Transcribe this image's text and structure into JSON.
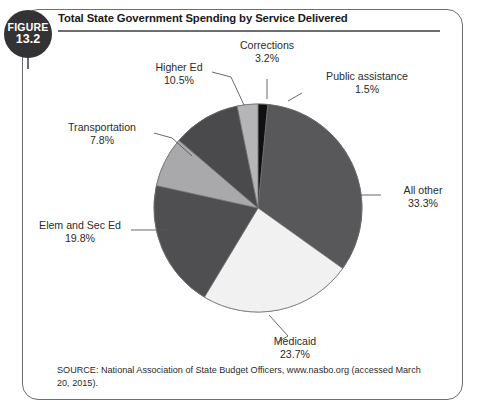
{
  "figure": {
    "badge_word": "FIGURE",
    "badge_number": "13.2",
    "title": "Total State Government Spending by Service Delivered",
    "source": "SOURCE: National Association of State Budget Officers, www.nasbo.org (accessed March 20, 2015)."
  },
  "chart_data": {
    "type": "pie",
    "title": "Total State Government Spending by Service Delivered",
    "xlabel": "",
    "ylabel": "",
    "grid": false,
    "legend_position": "none",
    "label_style": "external callout labels with leader lines",
    "value_unit": "percent",
    "start_angle_deg": 0,
    "direction": "clockwise",
    "total": 99.8,
    "categories": [
      "Public assistance",
      "All other",
      "Medicaid",
      "Elem and Sec Ed",
      "Transportation",
      "Higher Ed",
      "Corrections"
    ],
    "values": [
      1.5,
      33.3,
      23.7,
      19.8,
      7.8,
      10.5,
      3.2
    ],
    "slices": [
      {
        "label": "Public assistance",
        "value": 1.5,
        "value_text": "1.5%",
        "color": "#101011"
      },
      {
        "label": "All other",
        "value": 33.3,
        "value_text": "33.3%",
        "color": "#58585a"
      },
      {
        "label": "Medicaid",
        "value": 23.7,
        "value_text": "23.7%",
        "color": "#f1f1f1"
      },
      {
        "label": "Elem and Sec Ed",
        "value": 19.8,
        "value_text": "19.8%",
        "color": "#4f4f51"
      },
      {
        "label": "Transportation",
        "value": 7.8,
        "value_text": "7.8%",
        "color": "#a9a9ab"
      },
      {
        "label": "Higher Ed",
        "value": 10.5,
        "value_text": "10.5%",
        "color": "#4a4a4c"
      },
      {
        "label": "Corrections",
        "value": 3.2,
        "value_text": "3.2%",
        "color": "#b5b5b7"
      }
    ]
  }
}
